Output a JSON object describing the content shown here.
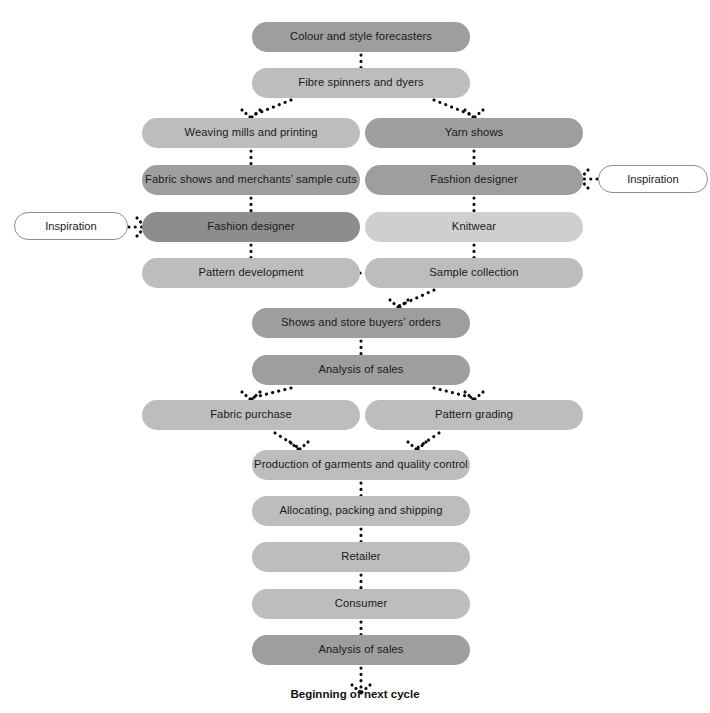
{
  "diagram": {
    "title_caption": "Beginning of next cycle",
    "colors": {
      "tone_dark": "#8d8d8d",
      "tone_mid": "#9e9e9e",
      "tone_light": "#bdbdbd",
      "tone_pale": "#cfcfcf",
      "arrow": "#0d0d0d",
      "outline_border": "#8e8e8e",
      "background": "#ffffff"
    },
    "nodes": [
      {
        "id": "colour-style-forecasters",
        "label": "Colour and style forecasters",
        "tone": "mid",
        "x": 252,
        "y": 22,
        "w": 218,
        "h": 30
      },
      {
        "id": "fibre-spinners-dyers",
        "label": "Fibre spinners and dyers",
        "tone": "light",
        "x": 252,
        "y": 68,
        "w": 218,
        "h": 30
      },
      {
        "id": "weaving-mills-printing",
        "label": "Weaving mills and printing",
        "tone": "light",
        "x": 142,
        "y": 118,
        "w": 218,
        "h": 30
      },
      {
        "id": "yarn-shows",
        "label": "Yarn shows",
        "tone": "mid",
        "x": 365,
        "y": 118,
        "w": 218,
        "h": 30
      },
      {
        "id": "fabric-shows-sample-cuts",
        "label": "Fabric shows and merchants’ sample cuts",
        "tone": "mid",
        "x": 142,
        "y": 165,
        "w": 218,
        "h": 30
      },
      {
        "id": "fashion-designer-right",
        "label": "Fashion designer",
        "tone": "mid",
        "x": 365,
        "y": 165,
        "w": 218,
        "h": 30
      },
      {
        "id": "fashion-designer-left",
        "label": "Fashion designer",
        "tone": "dark",
        "x": 142,
        "y": 212,
        "w": 218,
        "h": 30
      },
      {
        "id": "knitwear",
        "label": "Knitwear",
        "tone": "pale",
        "x": 365,
        "y": 212,
        "w": 218,
        "h": 30
      },
      {
        "id": "pattern-development",
        "label": "Pattern development",
        "tone": "light",
        "x": 142,
        "y": 258,
        "w": 218,
        "h": 30
      },
      {
        "id": "sample-collection",
        "label": "Sample collection",
        "tone": "light",
        "x": 365,
        "y": 258,
        "w": 218,
        "h": 30
      },
      {
        "id": "shows-store-buyers-orders",
        "label": "Shows and store buyers’ orders",
        "tone": "mid",
        "x": 252,
        "y": 308,
        "w": 218,
        "h": 30
      },
      {
        "id": "analysis-of-sales-top",
        "label": "Analysis of sales",
        "tone": "mid",
        "x": 252,
        "y": 355,
        "w": 218,
        "h": 30
      },
      {
        "id": "fabric-purchase",
        "label": "Fabric purchase",
        "tone": "light",
        "x": 142,
        "y": 400,
        "w": 218,
        "h": 30
      },
      {
        "id": "pattern-grading",
        "label": "Pattern grading",
        "tone": "light",
        "x": 365,
        "y": 400,
        "w": 218,
        "h": 30
      },
      {
        "id": "production-quality-control",
        "label": "Production of garments and quality control",
        "tone": "light",
        "x": 252,
        "y": 450,
        "w": 218,
        "h": 30
      },
      {
        "id": "allocating-packing-shipping",
        "label": "Allocating, packing and shipping",
        "tone": "light",
        "x": 252,
        "y": 496,
        "w": 218,
        "h": 30
      },
      {
        "id": "retailer",
        "label": "Retailer",
        "tone": "light",
        "x": 252,
        "y": 542,
        "w": 218,
        "h": 30
      },
      {
        "id": "consumer",
        "label": "Consumer",
        "tone": "light",
        "x": 252,
        "y": 589,
        "w": 218,
        "h": 30
      },
      {
        "id": "analysis-of-sales-bottom",
        "label": "Analysis of sales",
        "tone": "mid",
        "x": 252,
        "y": 635,
        "w": 218,
        "h": 30
      }
    ],
    "inspiration_nodes": [
      {
        "id": "inspiration-left",
        "label": "Inspiration",
        "x": 14,
        "y": 212,
        "w": 114,
        "h": 28
      },
      {
        "id": "inspiration-right",
        "label": "Inspiration",
        "x": 598,
        "y": 165,
        "w": 110,
        "h": 28
      }
    ],
    "arrows": [
      {
        "id": "forecasters-to-spinners",
        "from": "colour-style-forecasters",
        "to": "fibre-spinners-dyers",
        "kind": "vertical",
        "x": 361,
        "y1": 55,
        "y2": 66
      },
      {
        "id": "spinners-to-weaving",
        "from": "fibre-spinners-dyers",
        "to": "weaving-mills-printing",
        "kind": "diagonal",
        "x1": 291,
        "y1": 100,
        "x2": 251,
        "y2": 116
      },
      {
        "id": "spinners-to-yarn-shows",
        "from": "fibre-spinners-dyers",
        "to": "yarn-shows",
        "kind": "diagonal",
        "x1": 434,
        "y1": 100,
        "x2": 474,
        "y2": 116
      },
      {
        "id": "weaving-to-fabric-shows",
        "from": "weaving-mills-printing",
        "to": "fabric-shows-sample-cuts",
        "kind": "vertical",
        "x": 251,
        "y1": 151,
        "y2": 163
      },
      {
        "id": "yarn-shows-to-fashion-designer",
        "from": "yarn-shows",
        "to": "fashion-designer-right",
        "kind": "vertical",
        "x": 474,
        "y1": 151,
        "y2": 163
      },
      {
        "id": "fabric-shows-to-fashion-designer",
        "from": "fabric-shows-sample-cuts",
        "to": "fashion-designer-left",
        "kind": "vertical",
        "x": 251,
        "y1": 198,
        "y2": 210
      },
      {
        "id": "fashion-designer-to-knitwear",
        "from": "fashion-designer-right",
        "to": "knitwear",
        "kind": "vertical",
        "x": 474,
        "y1": 198,
        "y2": 210
      },
      {
        "id": "fashion-designer-to-pattern-dev",
        "from": "fashion-designer-left",
        "to": "pattern-development",
        "kind": "vertical",
        "x": 251,
        "y1": 245,
        "y2": 256
      },
      {
        "id": "knitwear-to-sample-collection",
        "from": "knitwear",
        "to": "sample-collection",
        "kind": "vertical",
        "x": 474,
        "y1": 245,
        "y2": 256
      },
      {
        "id": "sample-collection-to-pattern-dev",
        "from": "sample-collection",
        "to": "pattern-development",
        "kind": "horizontal-left",
        "y": 273,
        "x1": 345,
        "x2": 363
      },
      {
        "id": "inspiration-left-to-designer",
        "from": "inspiration-left",
        "to": "fashion-designer-left",
        "kind": "horizontal-right",
        "y": 227,
        "x1": 126,
        "x2": 143
      },
      {
        "id": "inspiration-right-to-designer",
        "from": "inspiration-right",
        "to": "fashion-designer-right",
        "kind": "horizontal-left",
        "y": 179,
        "x1": 582,
        "x2": 600
      },
      {
        "id": "sample-collection-to-shows",
        "from": "sample-collection",
        "to": "shows-store-buyers-orders",
        "kind": "diagonal",
        "x1": 434,
        "y1": 290,
        "x2": 399,
        "y2": 306
      },
      {
        "id": "shows-to-analysis",
        "from": "shows-store-buyers-orders",
        "to": "analysis-of-sales-top",
        "kind": "vertical",
        "x": 361,
        "y1": 341,
        "y2": 353
      },
      {
        "id": "analysis-to-fabric-purchase",
        "from": "analysis-of-sales-top",
        "to": "fabric-purchase",
        "kind": "diagonal",
        "x1": 291,
        "y1": 388,
        "x2": 251,
        "y2": 398
      },
      {
        "id": "analysis-to-pattern-grading",
        "from": "analysis-of-sales-top",
        "to": "pattern-grading",
        "kind": "diagonal",
        "x1": 434,
        "y1": 388,
        "x2": 474,
        "y2": 398
      },
      {
        "id": "fabric-purchase-to-production",
        "from": "fabric-purchase",
        "to": "production-quality-control",
        "kind": "diagonal",
        "x1": 275,
        "y1": 433,
        "x2": 299,
        "y2": 448
      },
      {
        "id": "pattern-grading-to-production",
        "from": "pattern-grading",
        "to": "production-quality-control",
        "kind": "diagonal",
        "x1": 439,
        "y1": 433,
        "x2": 417,
        "y2": 448
      },
      {
        "id": "production-to-allocating",
        "from": "production-quality-control",
        "to": "allocating-packing-shipping",
        "kind": "vertical",
        "x": 361,
        "y1": 483,
        "y2": 494
      },
      {
        "id": "allocating-to-retailer",
        "from": "allocating-packing-shipping",
        "to": "retailer",
        "kind": "vertical",
        "x": 361,
        "y1": 529,
        "y2": 540
      },
      {
        "id": "retailer-to-consumer",
        "from": "retailer",
        "to": "consumer",
        "kind": "vertical",
        "x": 361,
        "y1": 575,
        "y2": 587
      },
      {
        "id": "consumer-to-analysis",
        "from": "consumer",
        "to": "analysis-of-sales-bottom",
        "kind": "vertical",
        "x": 361,
        "y1": 622,
        "y2": 633
      },
      {
        "id": "analysis-to-next-cycle",
        "from": "analysis-of-sales-bottom",
        "to": "beginning-of-next-cycle",
        "kind": "vertical",
        "x": 361,
        "y1": 668,
        "y2": 681
      }
    ],
    "caption": {
      "text": "Beginning of next cycle",
      "x": 361,
      "y": 688
    }
  }
}
